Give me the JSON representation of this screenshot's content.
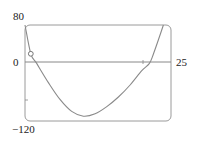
{
  "chart_data": {
    "type": "line",
    "title": "",
    "xlabel": "",
    "ylabel": "",
    "xlim": [
      0,
      25
    ],
    "ylim": [
      -120,
      80
    ],
    "tick_labels": {
      "y_top": "80",
      "y_zero": "0",
      "y_bottom": "−120",
      "x_right": "25"
    },
    "grid": false,
    "legend": null,
    "series": [
      {
        "name": "f(x)",
        "x": [
          0.0,
          1.0,
          2.0,
          4.0,
          6.0,
          8.0,
          10.0,
          12.0,
          14.0,
          16.0,
          18.0,
          20.0,
          21.3,
          22.0,
          23.7
        ],
        "y": [
          80,
          20,
          0,
          -40,
          -75,
          -100,
          -110,
          -105,
          -90,
          -70,
          -45,
          -15,
          0,
          20,
          80
        ]
      }
    ],
    "annotations": [
      {
        "type": "open-circle",
        "x": 1.0,
        "y": 20
      }
    ]
  },
  "labels": {
    "y_top": "80",
    "y_zero": "0",
    "y_bottom": "−120",
    "x_right": "25"
  }
}
